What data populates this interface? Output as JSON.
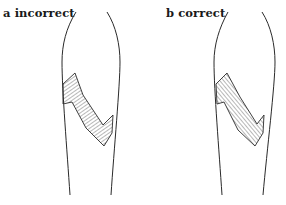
{
  "figure": {
    "panels": [
      {
        "id": "a",
        "label": "a incorrect"
      },
      {
        "id": "b",
        "label": "b correct"
      }
    ],
    "colors": {
      "line": "#2a2a2a",
      "background": "#ffffff"
    }
  }
}
